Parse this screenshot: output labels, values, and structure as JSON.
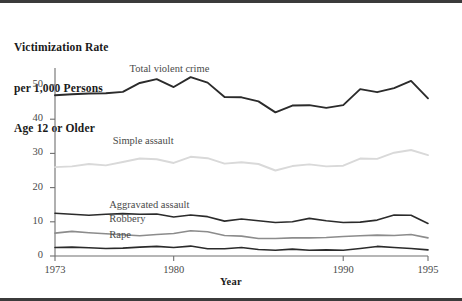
{
  "figure": {
    "title_lines": [
      "Victimization Rate",
      "per 1,000 Persons",
      "Age 12 or Older"
    ],
    "xaxis_title": "Year"
  },
  "chart_data": {
    "type": "line",
    "title": "Victimization Rate per 1,000 Persons Age 12 or Older",
    "xlabel": "Year",
    "ylabel": "Victimization Rate per 1,000 Persons Age 12 or Older",
    "xlim": [
      1973,
      1995
    ],
    "ylim": [
      0,
      55
    ],
    "grid": false,
    "legend": "inline-annotations",
    "xticks": [
      1973,
      1980,
      1990,
      1995
    ],
    "xtick_labels": [
      "1973",
      "1980",
      "1990",
      "1995"
    ],
    "yticks": [
      0,
      10,
      20,
      30,
      40,
      50
    ],
    "ytick_labels": [
      "0",
      "10",
      "20",
      "30",
      "40",
      "50"
    ],
    "x": [
      1973,
      1974,
      1975,
      1976,
      1977,
      1978,
      1979,
      1980,
      1981,
      1982,
      1983,
      1984,
      1985,
      1986,
      1987,
      1988,
      1989,
      1990,
      1991,
      1992,
      1993,
      1994,
      1995
    ],
    "series": [
      {
        "name": "Total violent crime",
        "color": "#2b2b2b",
        "width": 1.9,
        "label_x": 1977.4,
        "label_y": 54.0,
        "values": [
          47.0,
          47.3,
          47.5,
          47.6,
          48.0,
          50.6,
          51.7,
          49.4,
          52.3,
          50.7,
          46.5,
          46.4,
          45.2,
          42.0,
          44.0,
          44.1,
          43.3,
          44.1,
          48.8,
          47.9,
          49.1,
          51.2,
          46.1
        ]
      },
      {
        "name": "Simple assault",
        "color": "#d9d9d9",
        "width": 1.9,
        "label_x": 1976.4,
        "label_y": 33.0,
        "values": [
          26.0,
          26.2,
          26.9,
          26.5,
          27.5,
          28.5,
          28.3,
          27.2,
          29.0,
          28.6,
          27.0,
          27.4,
          26.9,
          25.0,
          26.3,
          26.8,
          26.2,
          26.4,
          28.5,
          28.4,
          30.2,
          31.0,
          29.5
        ]
      },
      {
        "name": "Aggravated assault",
        "color": "#2b2b2b",
        "width": 1.6,
        "label_x": 1976.2,
        "label_y": 14.4,
        "values": [
          12.5,
          12.2,
          11.9,
          12.2,
          12.4,
          12.2,
          12.3,
          11.4,
          12.0,
          11.5,
          10.2,
          10.8,
          10.3,
          9.8,
          10.0,
          11.0,
          10.3,
          9.8,
          9.9,
          10.5,
          12.0,
          11.9,
          9.5
        ]
      },
      {
        "name": "Robbery",
        "color": "#8c8c8c",
        "width": 1.6,
        "label_x": 1976.2,
        "label_y": 10.3,
        "values": [
          6.7,
          7.2,
          6.8,
          6.5,
          6.2,
          5.9,
          6.3,
          6.6,
          7.4,
          7.1,
          6.0,
          5.8,
          5.1,
          5.1,
          5.3,
          5.3,
          5.4,
          5.7,
          5.9,
          6.1,
          6.0,
          6.3,
          5.3
        ]
      },
      {
        "name": "Rape",
        "color": "#2b2b2b",
        "width": 1.6,
        "label_x": 1976.2,
        "label_y": 5.6,
        "values": [
          2.5,
          2.6,
          2.4,
          2.2,
          2.3,
          2.6,
          2.8,
          2.5,
          2.9,
          2.1,
          2.1,
          2.5,
          1.9,
          1.7,
          2.0,
          1.7,
          1.8,
          1.7,
          2.2,
          2.8,
          2.5,
          2.2,
          1.8
        ]
      }
    ]
  },
  "geometry": {
    "plot_left": 55,
    "plot_right": 428,
    "plot_bottom": 256,
    "y_top_value": 55,
    "y_px_per_unit": 3.42
  }
}
